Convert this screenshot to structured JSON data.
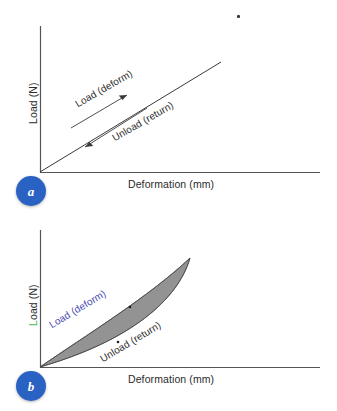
{
  "figure": {
    "caption_letters": [
      "a",
      "b"
    ],
    "background_color": "#ffffff",
    "axis_color": "#555555",
    "curve_color": "#3a3a3a",
    "loop_fill_color": "#8a8a8a",
    "badge_color": "#2a62c4",
    "label_blue_color": "#4a4ab4",
    "label_green_color": "#3fbf52"
  },
  "panel_a": {
    "badge": "a",
    "x_axis_label": "Deformation (mm)",
    "y_axis_label": "Load (N)",
    "load_label": "Load (deform)",
    "unload_label": "Unload (return)"
  },
  "panel_b": {
    "badge": "b",
    "x_axis_label": "Deformation (mm)",
    "y_axis_label": "Load (N)",
    "load_label": "Load (deform)",
    "unload_label": "Unload (return)"
  },
  "chart_data": [
    {
      "type": "line",
      "panel": "a",
      "title": "",
      "xlabel": "Deformation (mm)",
      "ylabel": "Load (N)",
      "xlim": [
        0,
        1
      ],
      "ylim": [
        0,
        1
      ],
      "grid": false,
      "legend": "none",
      "description": "Elastic behaviour: loading and unloading follow the same straight line, no hysteresis area enclosed.",
      "series": [
        {
          "name": "Load (deform)",
          "direction": "increasing",
          "x": [
            0.0,
            0.25,
            0.5,
            0.75,
            1.0
          ],
          "values": [
            0.0,
            0.19,
            0.38,
            0.56,
            0.75
          ]
        },
        {
          "name": "Unload (return)",
          "direction": "decreasing",
          "x": [
            1.0,
            0.75,
            0.5,
            0.25,
            0.0
          ],
          "values": [
            0.75,
            0.56,
            0.38,
            0.19,
            0.0
          ]
        }
      ],
      "annotations": [
        {
          "text": "Load (deform)",
          "arrow": "up-right"
        },
        {
          "text": "Unload (return)",
          "arrow": "down-left"
        }
      ]
    },
    {
      "type": "area",
      "panel": "b",
      "title": "",
      "xlabel": "Deformation (mm)",
      "ylabel": "Load (N)",
      "xlim": [
        0,
        1
      ],
      "ylim": [
        0,
        1
      ],
      "grid": false,
      "legend": "none",
      "description": "Viscoelastic behaviour: loading and unloading follow different paths, enclosing a shaded hysteresis loop representing dissipated energy.",
      "series": [
        {
          "name": "Load (deform)",
          "direction": "increasing",
          "x": [
            0.0,
            0.2,
            0.4,
            0.6,
            0.8,
            1.0
          ],
          "values": [
            0.0,
            0.17,
            0.36,
            0.56,
            0.77,
            1.0
          ]
        },
        {
          "name": "Unload (return)",
          "direction": "decreasing",
          "x": [
            1.0,
            0.8,
            0.6,
            0.4,
            0.2,
            0.0
          ],
          "values": [
            1.0,
            0.7,
            0.46,
            0.27,
            0.12,
            0.0
          ]
        }
      ],
      "annotations": [
        {
          "text": "Load (deform)",
          "arrow": "none"
        },
        {
          "text": "Unload (return)",
          "arrow": "none"
        }
      ]
    }
  ]
}
